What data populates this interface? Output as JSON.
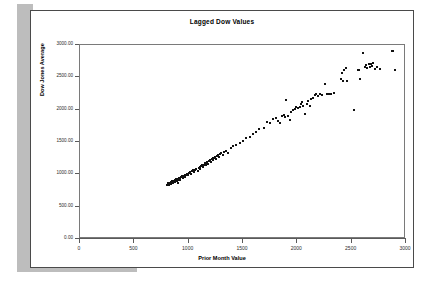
{
  "page": {
    "background_color": "#ffffff",
    "sheet_border_color": "#4a4a4a",
    "shadow_color": "#bdbdbd"
  },
  "chart_data": {
    "type": "scatter",
    "title": "Lagged Dow Values",
    "xlabel": "Prior Month Value",
    "ylabel": "Dow Jones Average",
    "xlim": [
      0,
      3000
    ],
    "ylim": [
      0,
      3000
    ],
    "grid": false,
    "legend": null,
    "marker_color": "#111111",
    "marker_shape": "square",
    "xticks": [
      0,
      500,
      1000,
      1500,
      2000,
      2500,
      3000
    ],
    "xtick_labels": [
      "0",
      "500",
      "1000",
      "1500",
      "2000",
      "2500",
      "3000"
    ],
    "yticks": [
      0,
      500,
      1000,
      1500,
      2000,
      2500,
      3000
    ],
    "ytick_labels": [
      "0.00",
      "500.00",
      "1000.00",
      "1500.00",
      "2000.00",
      "2500.00",
      "3000.00"
    ],
    "points": [
      [
        800,
        838
      ],
      [
        808,
        845
      ],
      [
        812,
        860
      ],
      [
        818,
        832
      ],
      [
        822,
        852
      ],
      [
        826,
        872
      ],
      [
        830,
        848
      ],
      [
        834,
        866
      ],
      [
        838,
        880
      ],
      [
        842,
        858
      ],
      [
        846,
        874
      ],
      [
        850,
        890
      ],
      [
        854,
        862
      ],
      [
        858,
        884
      ],
      [
        862,
        900
      ],
      [
        866,
        876
      ],
      [
        870,
        895
      ],
      [
        874,
        912
      ],
      [
        878,
        888
      ],
      [
        882,
        905
      ],
      [
        886,
        922
      ],
      [
        890,
        898
      ],
      [
        894,
        915
      ],
      [
        898,
        872
      ],
      [
        902,
        930
      ],
      [
        906,
        908
      ],
      [
        910,
        925
      ],
      [
        914,
        945
      ],
      [
        918,
        918
      ],
      [
        922,
        938
      ],
      [
        930,
        955
      ],
      [
        938,
        968
      ],
      [
        946,
        942
      ],
      [
        954,
        975
      ],
      [
        962,
        990
      ],
      [
        970,
        962
      ],
      [
        978,
        995
      ],
      [
        986,
        1012
      ],
      [
        994,
        985
      ],
      [
        1002,
        1018
      ],
      [
        1012,
        1035
      ],
      [
        1022,
        1008
      ],
      [
        1032,
        1045
      ],
      [
        1042,
        1062
      ],
      [
        1052,
        1030
      ],
      [
        1062,
        1072
      ],
      [
        1072,
        1090
      ],
      [
        1082,
        1058
      ],
      [
        1092,
        1100
      ],
      [
        1100,
        1118
      ],
      [
        1108,
        1085
      ],
      [
        1116,
        1128
      ],
      [
        1124,
        1145
      ],
      [
        1132,
        1112
      ],
      [
        1140,
        1152
      ],
      [
        1148,
        1170
      ],
      [
        1156,
        1138
      ],
      [
        1164,
        1178
      ],
      [
        1172,
        1196
      ],
      [
        1180,
        1162
      ],
      [
        1188,
        1205
      ],
      [
        1196,
        1222
      ],
      [
        1204,
        1188
      ],
      [
        1212,
        1232
      ],
      [
        1220,
        1248
      ],
      [
        1228,
        1215
      ],
      [
        1236,
        1258
      ],
      [
        1244,
        1275
      ],
      [
        1252,
        1240
      ],
      [
        1260,
        1282
      ],
      [
        1268,
        1300
      ],
      [
        1276,
        1265
      ],
      [
        1288,
        1308
      ],
      [
        1300,
        1330
      ],
      [
        1312,
        1295
      ],
      [
        1325,
        1342
      ],
      [
        1340,
        1360
      ],
      [
        1360,
        1330
      ],
      [
        1385,
        1400
      ],
      [
        1410,
        1432
      ],
      [
        1440,
        1455
      ],
      [
        1470,
        1488
      ],
      [
        1500,
        1520
      ],
      [
        1530,
        1560
      ],
      [
        1560,
        1580
      ],
      [
        1590,
        1620
      ],
      [
        1620,
        1660
      ],
      [
        1650,
        1700
      ],
      [
        1690,
        1720
      ],
      [
        1720,
        1810
      ],
      [
        1750,
        1790
      ],
      [
        1780,
        1855
      ],
      [
        1800,
        1870
      ],
      [
        1820,
        1830
      ],
      [
        1840,
        1790
      ],
      [
        1860,
        1900
      ],
      [
        1875,
        1920
      ],
      [
        1890,
        1885
      ],
      [
        1900,
        2150
      ],
      [
        1915,
        1900
      ],
      [
        1930,
        1840
      ],
      [
        1945,
        1960
      ],
      [
        1960,
        1995
      ],
      [
        1975,
        2010
      ],
      [
        1990,
        2035
      ],
      [
        2005,
        2020
      ],
      [
        2020,
        2045
      ],
      [
        2035,
        2080
      ],
      [
        2045,
        2125
      ],
      [
        2055,
        2060
      ],
      [
        2070,
        1940
      ],
      [
        2085,
        2090
      ],
      [
        2100,
        2135
      ],
      [
        2115,
        2060
      ],
      [
        2130,
        2160
      ],
      [
        2145,
        2185
      ],
      [
        2160,
        2230
      ],
      [
        2175,
        2250
      ],
      [
        2190,
        2205
      ],
      [
        2210,
        2240
      ],
      [
        2230,
        2230
      ],
      [
        2250,
        2400
      ],
      [
        2270,
        2245
      ],
      [
        2290,
        2250
      ],
      [
        2310,
        2240
      ],
      [
        2335,
        2265
      ],
      [
        2400,
        2480
      ],
      [
        2410,
        2565
      ],
      [
        2420,
        2450
      ],
      [
        2430,
        2620
      ],
      [
        2445,
        2640
      ],
      [
        2455,
        2450
      ],
      [
        2520,
        2000
      ],
      [
        2560,
        2610
      ],
      [
        2570,
        2620
      ],
      [
        2580,
        2470
      ],
      [
        2600,
        2880
      ],
      [
        2620,
        2655
      ],
      [
        2635,
        2690
      ],
      [
        2645,
        2640
      ],
      [
        2655,
        2700
      ],
      [
        2665,
        2660
      ],
      [
        2675,
        2710
      ],
      [
        2690,
        2680
      ],
      [
        2700,
        2720
      ],
      [
        2715,
        2630
      ],
      [
        2730,
        2660
      ],
      [
        2760,
        2625
      ],
      [
        2870,
        2900
      ],
      [
        2880,
        2905
      ],
      [
        2900,
        2620
      ]
    ]
  }
}
